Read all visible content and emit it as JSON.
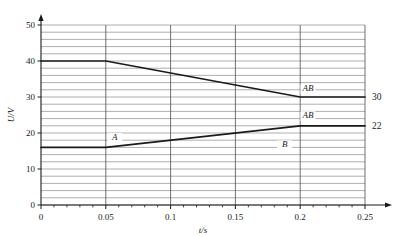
{
  "chart_data": {
    "type": "line",
    "title": "",
    "xlabel": "t/s",
    "ylabel": "U/V",
    "xlim": [
      0,
      0.25
    ],
    "ylim": [
      0,
      50
    ],
    "grid": true,
    "grid_minor_y_step": 2,
    "legend": "inline-labels",
    "x_ticks": [
      "0",
      "0.05",
      "0.1",
      "0.15",
      "0.2",
      "0.25"
    ],
    "x_tick_values": [
      0,
      0.05,
      0.1,
      0.15,
      0.2,
      0.25
    ],
    "y_ticks": [
      "0",
      "10",
      "20",
      "30",
      "40",
      "50"
    ],
    "y_tick_values": [
      0,
      10,
      20,
      30,
      40,
      50
    ],
    "series": [
      {
        "name": "AB-upper",
        "label": "AB",
        "x": [
          0,
          0.05,
          0.2,
          0.25
        ],
        "values": [
          40,
          40,
          30,
          30
        ],
        "end_value_label": "30"
      },
      {
        "name": "AB-lower",
        "label": "AB",
        "x": [
          0,
          0.05,
          0.2,
          0.25
        ],
        "values": [
          16,
          16,
          22,
          22
        ],
        "end_value_label": "22"
      }
    ],
    "annotations": [
      {
        "text": "A",
        "x": 0.057,
        "y": 18.0
      },
      {
        "text": "AB",
        "x": 0.206,
        "y": 31.6
      },
      {
        "text": "AB",
        "x": 0.206,
        "y": 24.1
      },
      {
        "text": "B",
        "x": 0.188,
        "y": 16.0
      }
    ]
  },
  "axes": {
    "y_axis_title": "U/V",
    "x_axis_title": "t/s"
  },
  "right_labels": [
    {
      "name": "upper-end-value",
      "text": "30"
    },
    {
      "name": "lower-end-value",
      "text": "22"
    }
  ],
  "colors": {
    "curve": "#1a1a1a",
    "grid": "#8d8d8d",
    "axis": "#1a1a1a",
    "text": "#1a1a1a",
    "background": "#ffffff"
  }
}
